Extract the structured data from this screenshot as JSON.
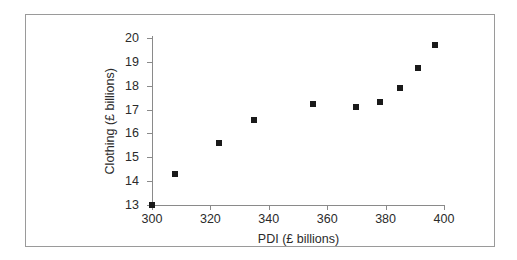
{
  "chart_data": {
    "type": "scatter",
    "title": "",
    "xlabel": "PDI (£ billions)",
    "ylabel": "Clothing (£ billions)",
    "xlim": [
      300,
      400
    ],
    "ylim": [
      13,
      20
    ],
    "xticks": [
      300,
      320,
      340,
      360,
      380,
      400
    ],
    "yticks": [
      13,
      14,
      15,
      16,
      17,
      18,
      19,
      20
    ],
    "xtick_labels": [
      "300",
      "320",
      "340",
      "360",
      "380",
      "400"
    ],
    "ytick_labels": [
      "13",
      "14",
      "15",
      "16",
      "17",
      "18",
      "19",
      "20"
    ],
    "grid": false,
    "legend": null,
    "marker": "square",
    "marker_color": "#1a1a1a",
    "x": [
      300,
      308,
      323,
      335,
      355,
      370,
      378,
      385,
      391,
      397
    ],
    "y": [
      13.0,
      14.3,
      15.6,
      16.55,
      17.25,
      17.1,
      17.3,
      17.9,
      18.75,
      19.7
    ],
    "points": [
      {
        "x": 300,
        "y": 13.0
      },
      {
        "x": 308,
        "y": 14.3
      },
      {
        "x": 323,
        "y": 15.6
      },
      {
        "x": 335,
        "y": 16.55
      },
      {
        "x": 355,
        "y": 17.25
      },
      {
        "x": 370,
        "y": 17.1
      },
      {
        "x": 378,
        "y": 17.3
      },
      {
        "x": 385,
        "y": 17.9
      },
      {
        "x": 391,
        "y": 18.75
      },
      {
        "x": 397,
        "y": 19.7
      }
    ]
  }
}
